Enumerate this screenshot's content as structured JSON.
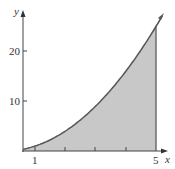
{
  "chart_data": {
    "type": "area",
    "title": "",
    "function": "y = x^2",
    "xlabel": "x",
    "ylabel": "y",
    "x_ticks": [
      1,
      2,
      3,
      4,
      5
    ],
    "x_tick_labels": [
      "1",
      "5"
    ],
    "y_ticks": [
      10,
      20
    ],
    "y_tick_labels": [
      "10",
      "20"
    ],
    "shaded_interval": [
      1,
      5
    ],
    "x": [
      0.6,
      1,
      2,
      3,
      4,
      5,
      5.2
    ],
    "values": [
      0.36,
      1,
      4,
      9,
      16,
      25,
      27
    ],
    "grid": false,
    "colors": {
      "curve": "#555555",
      "fill": "#c8c8c8",
      "axis": "#444444"
    }
  },
  "labels": {
    "x": "x",
    "y": "y",
    "t1": "1",
    "t5": "5",
    "t10": "10",
    "t20": "20"
  }
}
